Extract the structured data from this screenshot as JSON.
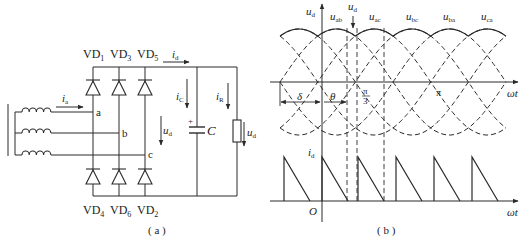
{
  "figure": {
    "panel_a": {
      "caption": "( a )",
      "top_diodes": [
        "VD1",
        "VD3",
        "VD5"
      ],
      "bottom_diodes": [
        "VD4",
        "VD6",
        "VD2"
      ],
      "diode_labels": {
        "vd1": {
          "main": "VD",
          "sub": "1"
        },
        "vd3": {
          "main": "VD",
          "sub": "3"
        },
        "vd5": {
          "main": "VD",
          "sub": "5"
        },
        "vd4": {
          "main": "VD",
          "sub": "4"
        },
        "vd6": {
          "main": "VD",
          "sub": "6"
        },
        "vd2": {
          "main": "VD",
          "sub": "2"
        }
      },
      "nodes": {
        "a": "a",
        "b": "b",
        "c": "c"
      },
      "currents": {
        "ia": {
          "main": "i",
          "sub": "a"
        },
        "id": {
          "main": "i",
          "sub": "d"
        },
        "ic": {
          "main": "i",
          "sub": "C"
        },
        "ir": {
          "main": "i",
          "sub": "R"
        }
      },
      "voltages": {
        "ud_bridge": {
          "main": "u",
          "sub": "d"
        },
        "ud_load": {
          "main": "u",
          "sub": "d"
        }
      },
      "capacitor": {
        "label": "C",
        "polarity": "+"
      }
    },
    "panel_b": {
      "caption": "( b )",
      "top_axis": {
        "ylabel_main": "u",
        "ylabel_sub": "d",
        "xlabel": "ωt"
      },
      "bottom_axis": {
        "ylabel_main": "i",
        "ylabel_sub": "d",
        "xlabel": "ωt",
        "origin": "O"
      },
      "ud_marker": {
        "main": "u",
        "sub": "d"
      },
      "line_voltages": [
        {
          "main": "u",
          "sub": "ab"
        },
        {
          "main": "u",
          "sub": "ac"
        },
        {
          "main": "u",
          "sub": "bc"
        },
        {
          "main": "u",
          "sub": "ba"
        },
        {
          "main": "u",
          "sub": "ca"
        }
      ],
      "angles": {
        "delta": "δ",
        "theta": "θ",
        "pi_over_3_num": "π",
        "pi_over_3_den": "3",
        "pi": "π"
      }
    }
  },
  "colors": {
    "line": "#2a2a2a",
    "background": "#ffffff"
  }
}
